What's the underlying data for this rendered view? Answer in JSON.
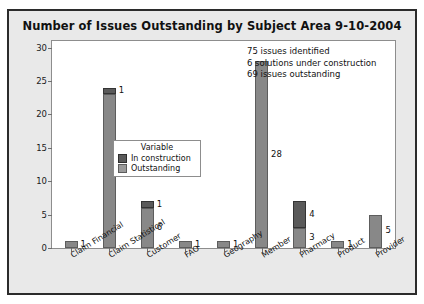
{
  "chart_data": {
    "type": "bar",
    "title": "Number of Issues Outstanding by Subject Area 9-10-2004",
    "xlabel": "",
    "ylabel": "",
    "ylim": [
      0,
      31
    ],
    "yticks": [
      0,
      5,
      10,
      15,
      20,
      25,
      30
    ],
    "grid": false,
    "stacked": true,
    "legend_position": "inside-center-left",
    "legend_title": "Variable",
    "categories": [
      "Claim Financial",
      "Claim Statistical",
      "Customer",
      "FAO",
      "Geography",
      "Member",
      "Pharmacy",
      "Product",
      "Provider"
    ],
    "series": [
      {
        "name": "Outstanding",
        "color": "#888888",
        "values": [
          1,
          23,
          6,
          1,
          1,
          28,
          3,
          1,
          5
        ]
      },
      {
        "name": "In construction",
        "color": "#5a5a5a",
        "values": [
          0,
          1,
          1,
          0,
          0,
          0,
          4,
          0,
          0
        ]
      }
    ],
    "bar_labels": {
      "outstanding": [
        "1",
        "23",
        "6",
        "1",
        "1",
        "28",
        "3",
        "1",
        "5"
      ],
      "construction": [
        "",
        "1",
        "1",
        "",
        "",
        "",
        "4",
        "",
        ""
      ]
    },
    "annotations": [
      "75  issues identified",
      "6 solutions under construction",
      "69 issues outstanding"
    ]
  }
}
